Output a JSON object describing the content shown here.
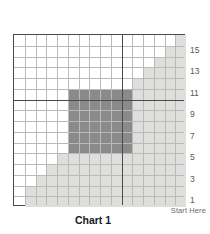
{
  "chart": {
    "title": "Chart 1",
    "start_label": "Start Here",
    "rows": 16,
    "cols": 16,
    "row_labels": [
      "15",
      "13",
      "11",
      "9",
      "7",
      "5",
      "3",
      "1"
    ],
    "row_label_rows": [
      2,
      4,
      6,
      8,
      10,
      12,
      14,
      16
    ],
    "major_line_after_col": 10,
    "major_line_after_row": 6,
    "colors": {
      "background": "#ffffff",
      "light_shade": "#dededc",
      "dark_shade": "#8a8a8a",
      "thin_gridline": "#b9b9b7",
      "thick_gridline": "#4a4a4a",
      "label_text": "#58585a",
      "title_text": "#1a1a1a"
    }
  },
  "chart_data": {
    "type": "heatmap",
    "title": "Chart 1",
    "xlabel": "",
    "ylabel": "",
    "grid": true,
    "legend_position": "none",
    "annotations": [
      "Start Here"
    ],
    "rows": 16,
    "cols": 16,
    "x": [
      1,
      2,
      3,
      4,
      5,
      6,
      7,
      8,
      9,
      10,
      11,
      12,
      13,
      14,
      15,
      16
    ],
    "tick_labels_right": [
      "15",
      "13",
      "11",
      "9",
      "7",
      "5",
      "3",
      "1"
    ],
    "value_legend": {
      "0": "white / empty",
      "1": "light grey",
      "2": "dark grey"
    },
    "matrix": [
      [
        0,
        0,
        0,
        0,
        0,
        0,
        0,
        0,
        0,
        0,
        0,
        0,
        0,
        0,
        0,
        1
      ],
      [
        0,
        0,
        0,
        0,
        0,
        0,
        0,
        0,
        0,
        0,
        0,
        0,
        0,
        0,
        1,
        1
      ],
      [
        0,
        0,
        0,
        0,
        0,
        0,
        0,
        0,
        0,
        0,
        0,
        0,
        0,
        1,
        1,
        1
      ],
      [
        0,
        0,
        0,
        0,
        0,
        0,
        0,
        0,
        0,
        0,
        0,
        0,
        1,
        1,
        1,
        1
      ],
      [
        0,
        0,
        0,
        0,
        0,
        0,
        0,
        0,
        0,
        0,
        0,
        1,
        1,
        1,
        1,
        1
      ],
      [
        0,
        0,
        0,
        0,
        0,
        2,
        2,
        2,
        2,
        2,
        2,
        1,
        1,
        1,
        1,
        1
      ],
      [
        0,
        0,
        0,
        0,
        0,
        2,
        2,
        2,
        2,
        2,
        2,
        1,
        1,
        1,
        1,
        1
      ],
      [
        0,
        0,
        0,
        0,
        0,
        2,
        2,
        2,
        2,
        2,
        2,
        1,
        1,
        1,
        1,
        1
      ],
      [
        0,
        0,
        0,
        0,
        0,
        2,
        2,
        2,
        2,
        2,
        2,
        1,
        1,
        1,
        1,
        1
      ],
      [
        0,
        0,
        0,
        0,
        0,
        2,
        2,
        2,
        2,
        2,
        2,
        1,
        1,
        1,
        1,
        1
      ],
      [
        0,
        0,
        0,
        0,
        0,
        2,
        2,
        2,
        2,
        2,
        2,
        1,
        1,
        1,
        1,
        1
      ],
      [
        0,
        0,
        0,
        0,
        1,
        1,
        1,
        1,
        1,
        1,
        1,
        1,
        1,
        1,
        1,
        1
      ],
      [
        0,
        0,
        0,
        1,
        1,
        1,
        1,
        1,
        1,
        1,
        1,
        1,
        1,
        1,
        1,
        1
      ],
      [
        0,
        0,
        1,
        1,
        1,
        1,
        1,
        1,
        1,
        1,
        1,
        1,
        1,
        1,
        1,
        1
      ],
      [
        0,
        1,
        1,
        1,
        1,
        1,
        1,
        1,
        1,
        1,
        1,
        1,
        1,
        1,
        1,
        1
      ],
      [
        0,
        1,
        1,
        1,
        1,
        1,
        1,
        1,
        1,
        1,
        1,
        1,
        1,
        1,
        1,
        1
      ]
    ]
  }
}
